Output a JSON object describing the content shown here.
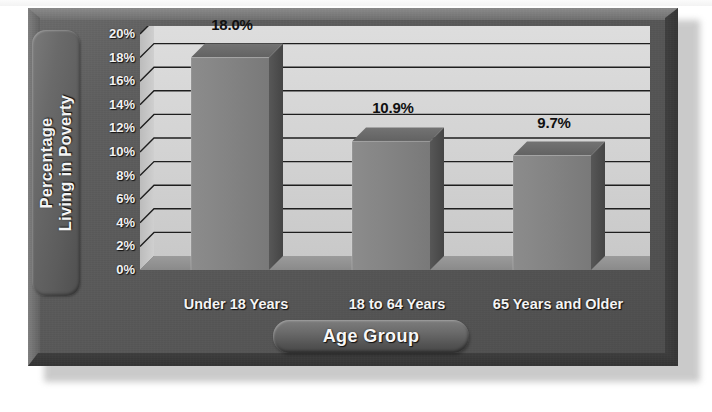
{
  "chart_data": {
    "type": "bar",
    "title": "",
    "subtitle": "",
    "categories": [
      "Under 18 Years",
      "18 to 64 Years",
      "65 Years and Older"
    ],
    "values": [
      18.0,
      10.9,
      9.7
    ],
    "value_labels": [
      "18.0%",
      "10.9%",
      "9.7%"
    ],
    "xlabel": "Age Group",
    "ylabel": "Percentage Living in Poverty",
    "ylabel_lines": [
      "Percentage",
      "Living in Poverty"
    ],
    "ylim": [
      0,
      20
    ],
    "ytick_step": 2,
    "ytick_labels": [
      "20%",
      "18%",
      "16%",
      "14%",
      "12%",
      "10%",
      "8%",
      "6%",
      "4%",
      "2%",
      "0%"
    ],
    "ytick_values": [
      20,
      18,
      16,
      14,
      12,
      10,
      8,
      6,
      4,
      2,
      0
    ],
    "grid": true,
    "grid_orientation": "horizontal",
    "legend": false,
    "legend_position": "none",
    "style": "3d-bar",
    "series": [
      {
        "name": "Percentage Living in Poverty",
        "values": [
          18.0,
          10.9,
          9.7
        ]
      }
    ]
  },
  "colors": {
    "frame": "#575757",
    "frame_highlight": "#8b8b8b",
    "frame_shadow": "#353535",
    "plot_background": "#d2d2d2",
    "plot_background_light": "#dcdcdc",
    "gridline": "#1e1e1e",
    "bar_front": "#818181",
    "bar_side": "#4f4f4f",
    "bar_top": "#6a6a6a",
    "axis_text": "#f4f4f4",
    "value_text": "#101010",
    "page_background": "#ffffff"
  },
  "axis_titles": {
    "y_pill_label": "Percentage Living in Poverty",
    "x_pill_label": "Age Group"
  }
}
